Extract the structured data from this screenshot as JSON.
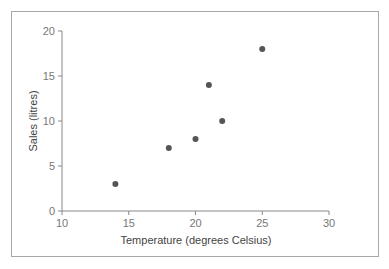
{
  "chart_data": {
    "type": "scatter",
    "title": "",
    "xlabel": "Temperature (degrees Celsius)",
    "ylabel": "Sales (litres)",
    "xlim": [
      10,
      30
    ],
    "ylim": [
      0,
      20
    ],
    "xticks": [
      10,
      15,
      20,
      25,
      30
    ],
    "yticks": [
      0,
      5,
      10,
      15,
      20
    ],
    "grid": false,
    "legend": null,
    "x": [
      14,
      18,
      20,
      21,
      22,
      25
    ],
    "y": [
      3,
      7,
      8,
      14,
      10,
      18
    ],
    "marker_color": "#555555"
  }
}
